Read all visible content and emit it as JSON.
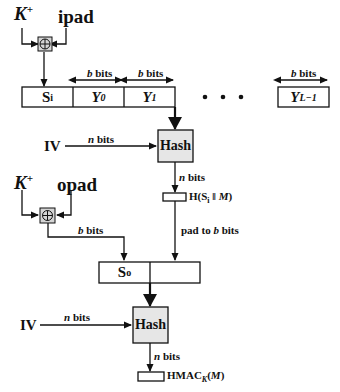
{
  "inner": {
    "key_label": "K",
    "key_sup": "+",
    "pad_label": "ipad",
    "blocks": [
      {
        "main": "S",
        "sub": "i",
        "italic": false
      },
      {
        "main": "Y",
        "sub": "0",
        "italic": true
      },
      {
        "main": "Y",
        "sub": "1",
        "italic": true
      },
      {
        "main": "Y",
        "sub": "L−1",
        "italic": true
      }
    ],
    "block_width_label_b": "b",
    "block_width_label_bits": " bits",
    "ellipsis": "•   •   •",
    "iv_label": "IV",
    "iv_width_n": "n",
    "iv_width_bits": " bits",
    "hash_label": "Hash",
    "out_width_n": "n",
    "out_width_bits": " bits",
    "result_label": "H(S",
    "result_sub": "i",
    "result_tail": " ‖ ",
    "result_m": "M",
    "result_close": ")"
  },
  "outer": {
    "key_label": "K",
    "key_sup": "+",
    "pad_label": "opad",
    "xor_width_b": "b",
    "xor_width_bits": " bits",
    "pad_note_pre": "pad to ",
    "pad_note_b": "b",
    "pad_note_post": " bits",
    "block_main": "S",
    "block_sub": "o",
    "iv_label": "IV",
    "iv_width_n": "n",
    "iv_width_bits": " bits",
    "hash_label": "Hash",
    "out_width_n": "n",
    "out_width_bits": " bits",
    "hmac_label": "HMAC",
    "hmac_sub": "K",
    "hmac_arg_open": "(",
    "hmac_arg": "M",
    "hmac_arg_close": ")"
  },
  "colors": {
    "line": "#111111",
    "hash_fill": "#e6e6e6",
    "xor_fill": "#d4d4d4"
  }
}
